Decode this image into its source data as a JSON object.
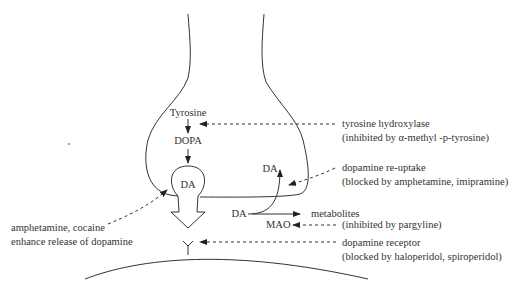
{
  "diagram": {
    "type": "dopaminergic synapse schematic",
    "presynaptic": {
      "synthesis": [
        "Tyrosine",
        "DOPA"
      ],
      "vesicle_label": "DA",
      "reuptake_label": "DA",
      "cytosol_label": "DA",
      "metabolites_label": "metabolites",
      "enzyme_label": "MAO"
    },
    "annotations": {
      "tyrosine_hydroxylase": {
        "line1": "tyrosine hydroxylase",
        "line2": "(inhibited by  α-methyl -p-tyrosine)"
      },
      "reuptake": {
        "line1": "dopamine re-uptake",
        "line2": "(blocked by amphetamine, imipramine)"
      },
      "mao": {
        "line1": "(inhibited by pargyline)"
      },
      "receptor": {
        "line1": "dopamine receptor",
        "line2": "(blocked by haloperidol, spiroperidol)"
      },
      "release": {
        "line1": "amphetamine, cocaine",
        "line2": "enhance release of dopamine"
      }
    },
    "colors": {
      "line": "#333333",
      "text": "#333333",
      "background": "#ffffff"
    }
  }
}
